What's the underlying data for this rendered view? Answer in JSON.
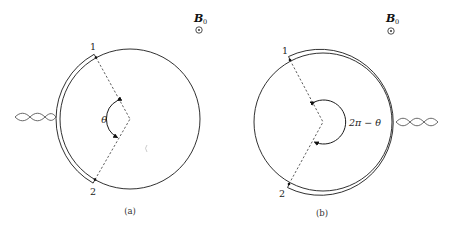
{
  "figure": {
    "panels": [
      {
        "id": "a",
        "caption": "(a)",
        "field_label": "B",
        "field_subscript": "0",
        "field_symbol": "⊙",
        "point_labels": [
          "1",
          "2"
        ],
        "angle_label": "θ",
        "contact_side": "left",
        "lead": "twisted-pair"
      },
      {
        "id": "b",
        "caption": "(b)",
        "field_label": "B",
        "field_subscript": "0",
        "field_symbol": "⊙",
        "point_labels": [
          "1",
          "2"
        ],
        "angle_label": "2π − θ",
        "contact_side": "right",
        "lead": "twisted-pair"
      }
    ]
  }
}
